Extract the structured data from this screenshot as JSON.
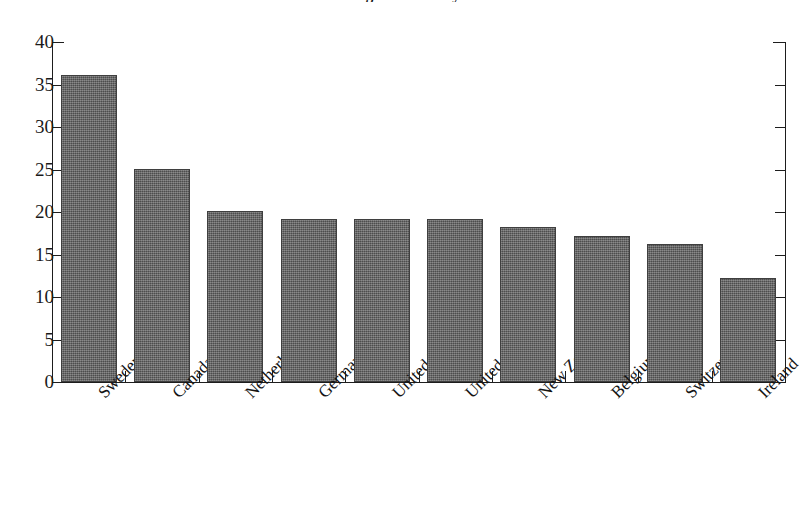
{
  "chart_data": {
    "type": "bar",
    "title": "at the Highest Literacy Level",
    "subtitle": "",
    "xlabel": "",
    "ylabel": "",
    "ylim": [
      0,
      40
    ],
    "yticks": [
      0,
      5,
      10,
      15,
      20,
      25,
      30,
      35,
      40
    ],
    "grid": false,
    "legend": null,
    "bar_color": "#5d5d5d",
    "categories": [
      "Sweden",
      "Canada",
      "Netherlands",
      "Germany",
      "United Kingdom",
      "United States",
      "New Zealand",
      "Belgium",
      "Switzerland",
      "Ireland"
    ],
    "values": [
      36.1,
      25.1,
      20.1,
      19.2,
      19.2,
      19.2,
      18.2,
      17.2,
      16.2,
      12.2
    ]
  },
  "axis": {
    "y_tick_labels": [
      "40",
      "35",
      "30",
      "25",
      "20",
      "15",
      "10",
      "5",
      "0"
    ]
  }
}
